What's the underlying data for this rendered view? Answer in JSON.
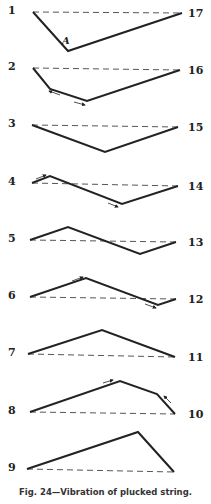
{
  "figure": {
    "caption": "Fig. 24—Vibration of plucked string.",
    "point_label": "A",
    "stroke_color": "#222222",
    "rows": [
      {
        "left_label": "1",
        "right_label": "17",
        "base": [
          [
            33,
            12
          ],
          [
            182,
            13
          ]
        ],
        "string": [
          [
            33,
            12
          ],
          [
            68,
            51
          ],
          [
            182,
            13
          ]
        ],
        "arrows": []
      },
      {
        "left_label": "2",
        "right_label": "16",
        "base": [
          [
            33,
            68
          ],
          [
            180,
            70
          ]
        ],
        "string": [
          [
            33,
            68
          ],
          [
            50,
            89
          ],
          [
            87,
            101
          ],
          [
            180,
            70
          ]
        ],
        "arrows": [
          [
            [
              60,
              95
            ],
            [
              49,
              91
            ]
          ],
          [
            [
              74,
              102
            ],
            [
              85,
              105
            ]
          ]
        ]
      },
      {
        "left_label": "3",
        "right_label": "15",
        "base": [
          [
            32,
            125
          ],
          [
            178,
            127
          ]
        ],
        "string": [
          [
            32,
            125
          ],
          [
            105,
            152
          ],
          [
            178,
            127
          ]
        ],
        "arrows": []
      },
      {
        "left_label": "4",
        "right_label": "14",
        "base": [
          [
            32,
            183
          ],
          [
            178,
            186
          ]
        ],
        "string": [
          [
            32,
            183
          ],
          [
            50,
            176
          ],
          [
            122,
            204
          ],
          [
            178,
            186
          ]
        ],
        "arrows": [
          [
            [
              36,
              179
            ],
            [
              46,
              175
            ]
          ],
          [
            [
              108,
              203
            ],
            [
              118,
              207
            ]
          ]
        ]
      },
      {
        "left_label": "5",
        "right_label": "13",
        "base": [
          [
            30,
            240
          ],
          [
            176,
            242
          ]
        ],
        "string": [
          [
            30,
            240
          ],
          [
            68,
            227
          ],
          [
            140,
            254
          ],
          [
            176,
            242
          ]
        ],
        "arrows": []
      },
      {
        "left_label": "6",
        "right_label": "12",
        "base": [
          [
            30,
            297
          ],
          [
            176,
            299
          ]
        ],
        "string": [
          [
            30,
            297
          ],
          [
            86,
            278
          ],
          [
            158,
            305
          ],
          [
            176,
            299
          ]
        ],
        "arrows": [
          [
            [
              72,
              281
            ],
            [
              83,
              277
            ]
          ],
          [
            [
              145,
              304
            ],
            [
              156,
              308
            ]
          ]
        ]
      },
      {
        "left_label": "7",
        "right_label": "11",
        "base": [
          [
            28,
            354
          ],
          [
            175,
            357
          ]
        ],
        "string": [
          [
            28,
            354
          ],
          [
            102,
            330
          ],
          [
            175,
            357
          ]
        ],
        "arrows": []
      },
      {
        "left_label": "8",
        "right_label": "10",
        "base": [
          [
            30,
            412
          ],
          [
            175,
            414
          ]
        ],
        "string": [
          [
            30,
            412
          ],
          [
            120,
            381
          ],
          [
            157,
            394
          ],
          [
            175,
            414
          ]
        ],
        "arrows": [
          [
            [
              103,
              383
            ],
            [
              113,
              380
            ]
          ],
          [
            [
              171,
              403
            ],
            [
              164,
              396
            ]
          ]
        ]
      },
      {
        "left_label": "9",
        "right_label": "",
        "base": [
          [
            27,
            469
          ],
          [
            174,
            472
          ]
        ],
        "string": [
          [
            27,
            469
          ],
          [
            138,
            432
          ],
          [
            174,
            472
          ]
        ],
        "arrows": []
      }
    ]
  }
}
